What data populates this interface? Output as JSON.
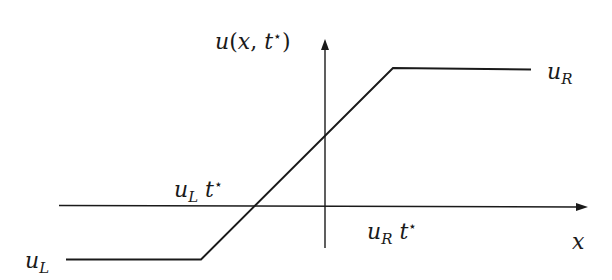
{
  "diagram": {
    "type": "riemann-rarefaction-profile",
    "colors": {
      "line": "#1a1a1a",
      "background": "#ffffff"
    },
    "axes": {
      "y_label": {
        "base": "u",
        "open": "(",
        "arg1": "x",
        "comma": ", ",
        "arg2": "t",
        "star": "⋆",
        "close": ")"
      },
      "x_label": "x"
    },
    "curve": {
      "left_state": {
        "base": "u",
        "sub": "L"
      },
      "right_state": {
        "base": "u",
        "sub": "R"
      },
      "left_front": {
        "base": "u",
        "sub": "L",
        "t": "t",
        "star": "⋆"
      },
      "right_front": {
        "base": "u",
        "sub": "R",
        "t": "t",
        "star": "⋆"
      }
    }
  }
}
